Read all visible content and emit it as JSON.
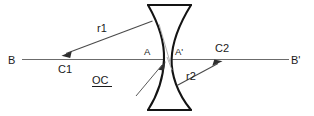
{
  "diagram": {
    "type": "optics-lens-diagram",
    "labels": {
      "axis_left": "B",
      "axis_right": "B'",
      "center_curvature_left": "C1",
      "center_curvature_right": "C2",
      "radius_left": "r1",
      "radius_right": "r2",
      "vertex_left": "A",
      "vertex_right": "A'",
      "optical_center": "OC"
    },
    "colors": {
      "lens_outline": "#141414",
      "axis": "#6b6b6b",
      "ray": "#4a4a4a",
      "text": "#1a1a1a",
      "background": "#ffffff",
      "arrow_fill": "#2e2e2e"
    },
    "elements": {
      "optical_axis": "horizontal line B to B'",
      "lens_shape": "biconcave",
      "radius_arrow_left": "arrow from lens upper-left surface toward C1",
      "radius_arrow_right": "arrow from lens lower-right surface toward C2",
      "optical_center_leader": "underlined OC label with leader arrow to lens center"
    }
  }
}
